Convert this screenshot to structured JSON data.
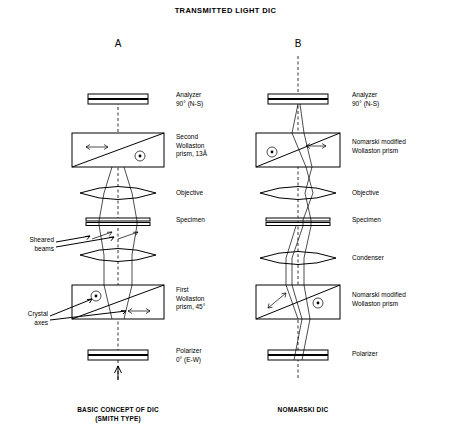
{
  "title": "TRANSMITTED LIGHT DIC",
  "columns": [
    {
      "letter": "A",
      "caption_line1": "BASIC CONCEPT OF DIC",
      "caption_line2": "(SMITH TYPE)",
      "components": [
        {
          "name": "analyzer",
          "label": "Analyzer\n90° (N-S)"
        },
        {
          "name": "second-wollaston-prism",
          "label": "Second\nWollaston\nprism, 13Å"
        },
        {
          "name": "objective",
          "label": "Objective"
        },
        {
          "name": "specimen",
          "label": "Specimen"
        },
        {
          "name": "first-wollaston-prism",
          "label": "First\nWollaston\nprism, 45°"
        },
        {
          "name": "polarizer",
          "label": "Polarizer\n0° (E-W)"
        }
      ]
    },
    {
      "letter": "B",
      "caption_line1": "NOMARSKI  DIC",
      "caption_line2": "",
      "components": [
        {
          "name": "analyzer",
          "label": "Analyzer\n90° (N-S)"
        },
        {
          "name": "nomarski-prism-top",
          "label": "Nomarski modified\nWollaston prism"
        },
        {
          "name": "objective",
          "label": "Objective"
        },
        {
          "name": "specimen",
          "label": "Specimen"
        },
        {
          "name": "condenser",
          "label": "Condenser"
        },
        {
          "name": "nomarski-prism-bottom",
          "label": "Nomarski modified\nWollaston prism"
        },
        {
          "name": "polarizer",
          "label": "Polarizer"
        }
      ]
    }
  ],
  "annotations": [
    {
      "name": "sheared-beams",
      "label": "Sheared\nbeams"
    },
    {
      "name": "crystal-axes",
      "label": "Crystal\naxes"
    }
  ]
}
